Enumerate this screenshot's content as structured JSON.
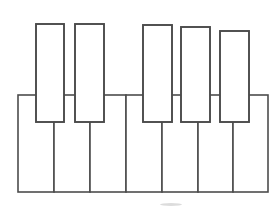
{
  "diagram": {
    "type": "piano-keyboard",
    "canvas": {
      "width": 274,
      "height": 214,
      "background": "#ffffff"
    },
    "style": {
      "white_key_fill": "#ffffff",
      "white_key_stroke": "#4d4d4d",
      "white_key_stroke_width": 1.6,
      "black_key_fill": "#ffffff",
      "black_key_stroke": "#4a4a4a",
      "black_key_stroke_width": 1.9,
      "smudge_color": "#bfbfbf"
    },
    "white_keys": {
      "count": 7,
      "top": 95,
      "bottom": 192,
      "left": 18,
      "right": 268,
      "keys": [
        {
          "index": 0,
          "x": 18,
          "y": 95,
          "width": 36,
          "height": 97
        },
        {
          "index": 1,
          "x": 54,
          "y": 95,
          "width": 36,
          "height": 97
        },
        {
          "index": 2,
          "x": 90,
          "y": 95,
          "width": 36,
          "height": 97
        },
        {
          "index": 3,
          "x": 126,
          "y": 95,
          "width": 36,
          "height": 97
        },
        {
          "index": 4,
          "x": 162,
          "y": 95,
          "width": 36,
          "height": 97
        },
        {
          "index": 5,
          "x": 198,
          "y": 95,
          "width": 35,
          "height": 97
        },
        {
          "index": 6,
          "x": 233,
          "y": 95,
          "width": 35,
          "height": 97
        }
      ]
    },
    "black_keys": {
      "count": 5,
      "group_of_two": [
        {
          "index": 0,
          "x": 36,
          "y": 24,
          "width": 28,
          "height": 98
        },
        {
          "index": 1,
          "x": 75,
          "y": 24,
          "width": 29,
          "height": 98
        }
      ],
      "group_of_three": [
        {
          "index": 2,
          "x": 143,
          "y": 25,
          "width": 29,
          "height": 97
        },
        {
          "index": 3,
          "x": 181,
          "y": 27,
          "width": 29,
          "height": 95
        },
        {
          "index": 4,
          "x": 220,
          "y": 31,
          "width": 29,
          "height": 91
        }
      ]
    },
    "artifacts": [
      {
        "name": "bottom-smudge",
        "x": 160,
        "y": 203,
        "width": 22,
        "height": 3
      }
    ]
  }
}
